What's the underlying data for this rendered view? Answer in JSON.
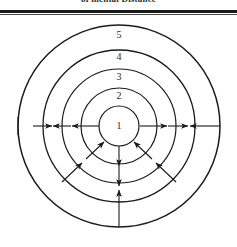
{
  "figure": {
    "caption_above_rule": "of mental Distance",
    "title_visible": false,
    "background_color": "#ffffff",
    "stroke_color": "#1b1b1b"
  },
  "diagram": {
    "type": "concentric-circles",
    "center": {
      "x": 119,
      "y": 112
    },
    "ring_count": 5,
    "rings": [
      {
        "label": "1",
        "radius": 20,
        "label_x": 119,
        "label_y": 112
      },
      {
        "label": "2",
        "radius": 38,
        "label_x": 119,
        "label_y": 83
      },
      {
        "label": "3",
        "radius": 57,
        "label_x": 119,
        "label_y": 64
      },
      {
        "label": "4",
        "radius": 76,
        "label_x": 119,
        "label_y": 44
      },
      {
        "label": "5",
        "radius": 101,
        "label_x": 119,
        "label_y": 22
      }
    ],
    "ring_stroke_widths": [
      1.2,
      1.2,
      1.2,
      1.3,
      1.5
    ],
    "horizontal_axis": {
      "y": 112,
      "left_end_x": 18,
      "right_end_x": 220,
      "arrows": [
        {
          "id": "left-outward-1",
          "from_x": 33,
          "to_x": 52,
          "direction": "right"
        },
        {
          "id": "left-inward-1",
          "from_x": 71,
          "to_x": 53,
          "direction": "left"
        },
        {
          "id": "left-inward-2",
          "from_x": 99,
          "to_x": 72,
          "direction": "left"
        },
        {
          "id": "right-outward-1",
          "from_x": 140,
          "to_x": 167,
          "direction": "right"
        },
        {
          "id": "right-outward-2",
          "from_x": 168,
          "to_x": 188,
          "direction": "right"
        },
        {
          "id": "right-inward-1",
          "from_x": 220,
          "to_x": 190,
          "direction": "left"
        }
      ]
    },
    "vertical_axis": {
      "x": 119,
      "top_y": 132,
      "bottom_y": 213,
      "arrows": [
        {
          "id": "down-1",
          "from_y": 132,
          "to_y": 152,
          "direction": "down"
        },
        {
          "id": "down-2",
          "from_y": 152,
          "to_y": 172,
          "direction": "down"
        },
        {
          "id": "up-1",
          "from_y": 213,
          "to_y": 176,
          "direction": "up"
        }
      ]
    },
    "diagonal_arrows": [
      {
        "id": "lower-left-inner",
        "from_x": 86,
        "from_y": 145,
        "to_x": 104,
        "to_y": 128,
        "direction": "inward"
      },
      {
        "id": "lower-left-outer",
        "from_x": 62,
        "from_y": 168,
        "to_x": 82,
        "to_y": 149,
        "direction": "inward"
      },
      {
        "id": "lower-right-inner",
        "from_x": 152,
        "from_y": 145,
        "to_x": 134,
        "to_y": 128,
        "direction": "inward"
      },
      {
        "id": "lower-right-outer",
        "from_x": 176,
        "from_y": 168,
        "to_x": 156,
        "to_y": 149,
        "direction": "inward"
      }
    ]
  }
}
